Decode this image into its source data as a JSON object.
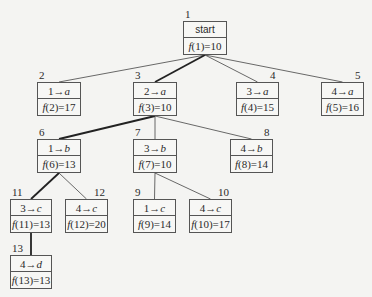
{
  "diagram": {
    "type": "search-tree",
    "nodes": [
      {
        "id": "1",
        "label": "start",
        "f": "f(1)=10",
        "x": 183,
        "y": 21,
        "w": 44,
        "h": 34
      },
      {
        "id": "2",
        "label": "1→a",
        "f": "f(2)=17",
        "x": 37,
        "y": 82,
        "w": 44,
        "h": 34
      },
      {
        "id": "3",
        "label": "2→a",
        "f": "f(3)=10",
        "x": 133,
        "y": 82,
        "w": 44,
        "h": 34
      },
      {
        "id": "4",
        "label": "3→a",
        "f": "f(4)=15",
        "x": 236,
        "y": 82,
        "w": 43,
        "h": 34
      },
      {
        "id": "5",
        "label": "4→a",
        "f": "f(5)=16",
        "x": 321,
        "y": 82,
        "w": 43,
        "h": 34
      },
      {
        "id": "6",
        "label": "1→b",
        "f": "f(6)=13",
        "x": 37,
        "y": 139,
        "w": 44,
        "h": 34
      },
      {
        "id": "7",
        "label": "3→b",
        "f": "f(7)=10",
        "x": 133,
        "y": 139,
        "w": 44,
        "h": 34
      },
      {
        "id": "8",
        "label": "4→b",
        "f": "f(8)=14",
        "x": 230,
        "y": 139,
        "w": 43,
        "h": 34
      },
      {
        "id": "11",
        "label": "3→c",
        "f": "f(11)=13",
        "x": 10,
        "y": 199,
        "w": 42,
        "h": 34
      },
      {
        "id": "12",
        "label": "4→c",
        "f": "f(12)=20",
        "x": 65,
        "y": 199,
        "w": 43,
        "h": 34
      },
      {
        "id": "9",
        "label": "1→c",
        "f": "f(9)=14",
        "x": 133,
        "y": 199,
        "w": 43,
        "h": 34
      },
      {
        "id": "10",
        "label": "4→c",
        "f": "f(10)=17",
        "x": 189,
        "y": 199,
        "w": 43,
        "h": 34
      },
      {
        "id": "13",
        "label": "4→d",
        "f": "f(13)=13",
        "x": 10,
        "y": 255,
        "w": 42,
        "h": 34
      }
    ],
    "edges": [
      {
        "from": "1",
        "to": "2",
        "bold": false
      },
      {
        "from": "1",
        "to": "3",
        "bold": true
      },
      {
        "from": "1",
        "to": "4",
        "bold": false
      },
      {
        "from": "1",
        "to": "5",
        "bold": false
      },
      {
        "from": "3",
        "to": "6",
        "bold": true
      },
      {
        "from": "3",
        "to": "7",
        "bold": false
      },
      {
        "from": "3",
        "to": "8",
        "bold": false
      },
      {
        "from": "6",
        "to": "11",
        "bold": true
      },
      {
        "from": "6",
        "to": "12",
        "bold": false
      },
      {
        "from": "7",
        "to": "9",
        "bold": false
      },
      {
        "from": "7",
        "to": "10",
        "bold": false
      },
      {
        "from": "11",
        "to": "13",
        "bold": true
      }
    ]
  },
  "colors": {
    "line": "#444444",
    "bold_line": "#222222",
    "box_border": "#555555",
    "background": "#f4f4f2"
  }
}
